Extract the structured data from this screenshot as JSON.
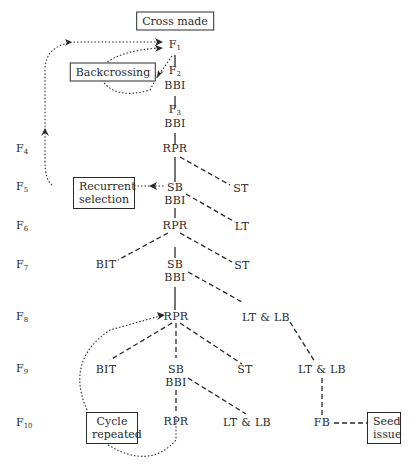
{
  "diagram": {
    "title_box": "Cross made",
    "boxes": {
      "backcrossing": "Backcrossing",
      "recurrent_selection_line1": "Recurrent",
      "recurrent_selection_line2": "selection",
      "cycle_repeated_line1": "Cycle",
      "cycle_repeated_line2": "repeated",
      "seed_issue_line1": "Seed",
      "seed_issue_line2": "issue"
    },
    "generations": [
      {
        "base": "F",
        "sub": "4"
      },
      {
        "base": "F",
        "sub": "5"
      },
      {
        "base": "F",
        "sub": "6"
      },
      {
        "base": "F",
        "sub": "7"
      },
      {
        "base": "F",
        "sub": "8"
      },
      {
        "base": "F",
        "sub": "9"
      },
      {
        "base": "F",
        "sub": "10"
      }
    ],
    "main_nodes": {
      "f1": {
        "base": "F",
        "sub": "1"
      },
      "f2": {
        "base": "F",
        "sub": "2"
      },
      "bbi1": "BBI",
      "f3": {
        "base": "F",
        "sub": "3"
      },
      "bbi2": "BBI",
      "rpr_f4": "RPR",
      "sb_f5": "SB",
      "bbi_f5": "BBI",
      "rpr_f6": "RPR",
      "sb_f7": "SB",
      "bbi_f7": "BBI",
      "rpr_f8": "RPR",
      "sb_f9": "SB",
      "bbi_f9": "BBI",
      "rpr_f10": "RPR"
    },
    "branch_nodes": {
      "st_f5": "ST",
      "lt_f6": "LT",
      "bit_f7": "BIT",
      "st_f7": "ST",
      "ltlb_f8": "LT & LB",
      "bit_f9": "BIT",
      "st_f9": "ST",
      "ltlb_f9": "LT & LB",
      "ltlb_f10": "LT & LB",
      "fb_f10": "FB"
    },
    "colors": {
      "ink": "#2a2a2a",
      "background": "#ffffff"
    }
  }
}
